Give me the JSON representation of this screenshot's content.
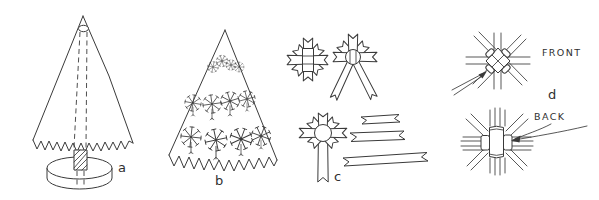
{
  "labels": {
    "panel_a": "a",
    "panel_b": "b",
    "panel_c": "c",
    "panel_d": "d",
    "front": "FRONT",
    "back": "BACK"
  },
  "colors": {
    "ink": "#3a3a3a",
    "paper": "#ffffff"
  }
}
